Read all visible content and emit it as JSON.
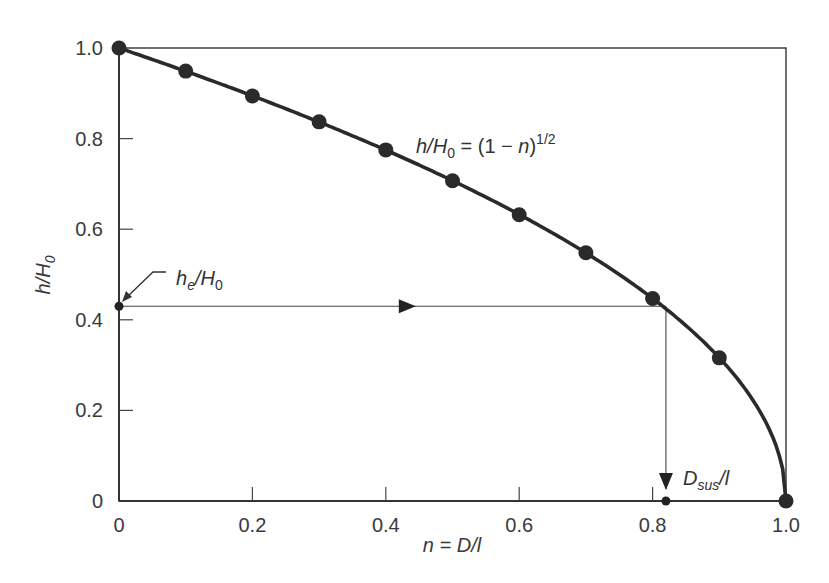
{
  "chart_data": {
    "type": "line",
    "title": "",
    "xlabel": "n = D/l",
    "ylabel": "h/H0",
    "xlim": [
      0,
      1.0
    ],
    "ylim": [
      0,
      1.0
    ],
    "grid": false,
    "x_ticks": [
      "0",
      "0.2",
      "0.4",
      "0.6",
      "0.8",
      "1.0"
    ],
    "y_ticks": [
      "0",
      "0.2",
      "0.4",
      "0.6",
      "0.8",
      "1.0"
    ],
    "series": [
      {
        "name": "h/H0 = (1 − n)^1/2",
        "x": [
          0,
          0.1,
          0.2,
          0.3,
          0.4,
          0.5,
          0.6,
          0.7,
          0.8,
          0.9,
          1.0
        ],
        "values": [
          1.0,
          0.949,
          0.894,
          0.837,
          0.775,
          0.707,
          0.632,
          0.548,
          0.447,
          0.316,
          0.0
        ],
        "markers": true
      }
    ],
    "annotations": [
      {
        "text": "h/H0 = (1 − n)^1/2",
        "x": 0.45,
        "y": 0.83
      },
      {
        "text": "he/H0",
        "x": 0.0,
        "y": 0.43,
        "arrow": true
      },
      {
        "text": "Dsus/l",
        "x": 0.82,
        "y": 0.0
      }
    ],
    "construction_lines": {
      "he_over_H0": 0.43,
      "Dsus_over_l": 0.82
    }
  },
  "labels": {
    "xlabel_n": "n",
    "xlabel_rest": " = D/l",
    "ylabel_h": "h/H",
    "ylabel_sub": "0",
    "eq_lhs": "h/H",
    "eq_sub": "0",
    "eq_rhs": " = (1 − ",
    "eq_n": "n",
    "eq_close": ")",
    "eq_sup": "1/2",
    "he_h": "h",
    "he_sub": "e",
    "he_rest": "/H",
    "he_sub2": "0",
    "dsus_D": "D",
    "dsus_sub": "sus",
    "dsus_rest": "/l"
  }
}
